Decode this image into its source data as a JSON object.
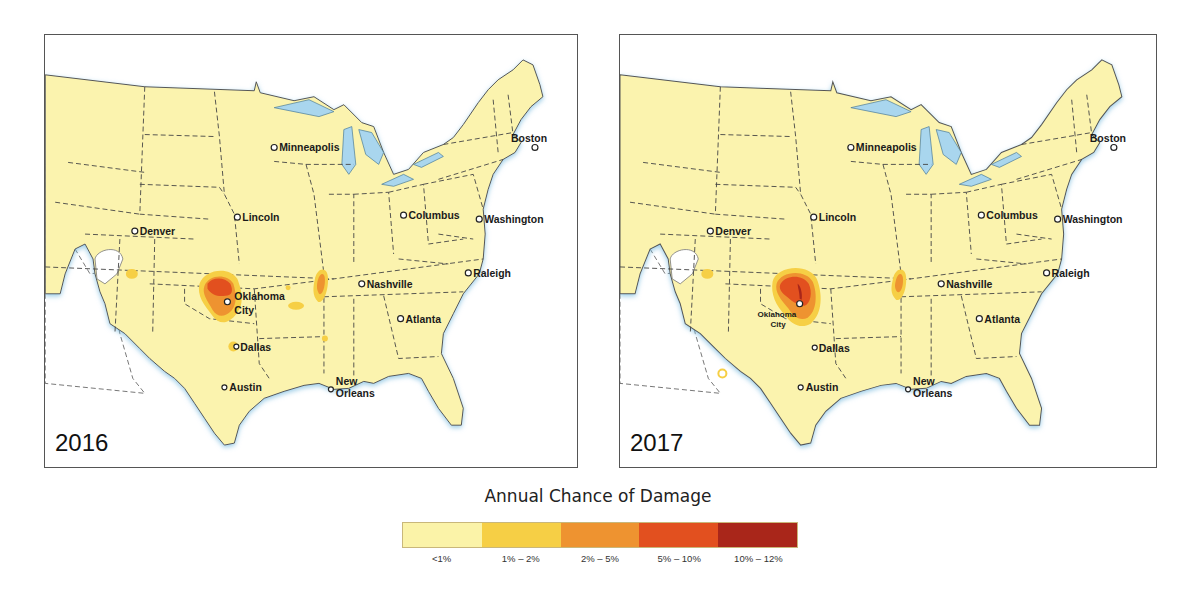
{
  "maps": [
    {
      "year": "2016",
      "cities": [
        {
          "name": "Minneapolis",
          "x": 230,
          "y": 108
        },
        {
          "name": "Boston",
          "x": 465,
          "y": 103
        },
        {
          "name": "Lincoln",
          "x": 193,
          "y": 183
        },
        {
          "name": "Columbus",
          "x": 360,
          "y": 181
        },
        {
          "name": "Washington",
          "x": 436,
          "y": 185
        },
        {
          "name": "Denver",
          "x": 90,
          "y": 197
        },
        {
          "name": "Raleigh",
          "x": 425,
          "y": 239
        },
        {
          "name": "Nashville",
          "x": 318,
          "y": 250
        },
        {
          "name": "Oklahoma",
          "x": 186,
          "y": 262
        },
        {
          "name": "City",
          "x": 186,
          "y": 276
        },
        {
          "name": "Atlanta",
          "x": 357,
          "y": 285
        },
        {
          "name": "Dallas",
          "x": 192,
          "y": 313
        },
        {
          "name": "Austin",
          "x": 180,
          "y": 354
        },
        {
          "name": "New",
          "x": 290,
          "y": 350
        },
        {
          "name": "Orleans",
          "x": 290,
          "y": 362
        }
      ]
    },
    {
      "year": "2017",
      "cities": [
        {
          "name": "Minneapolis",
          "x": 234,
          "y": 108
        },
        {
          "name": "Boston",
          "x": 473,
          "y": 103
        },
        {
          "name": "Lincoln",
          "x": 196,
          "y": 183
        },
        {
          "name": "Columbus",
          "x": 367,
          "y": 181
        },
        {
          "name": "Washington",
          "x": 443,
          "y": 185
        },
        {
          "name": "Denver",
          "x": 92,
          "y": 197
        },
        {
          "name": "Raleigh",
          "x": 432,
          "y": 239
        },
        {
          "name": "Nashville",
          "x": 326,
          "y": 250
        },
        {
          "name": "Oklahoma",
          "x": 140,
          "y": 275
        },
        {
          "name": "City",
          "x": 140,
          "y": 284
        },
        {
          "name": "Atlanta",
          "x": 364,
          "y": 285
        },
        {
          "name": "Dallas",
          "x": 198,
          "y": 313
        },
        {
          "name": "Austin",
          "x": 185,
          "y": 354
        },
        {
          "name": "New",
          "x": 295,
          "y": 350
        },
        {
          "name": "Orleans",
          "x": 295,
          "y": 362
        }
      ]
    }
  ],
  "legend": {
    "title": "Annual Chance of Damage",
    "items": [
      {
        "label": "<1%",
        "color": "#fbf3a8"
      },
      {
        "label": "1% – 2%",
        "color": "#f6cf45"
      },
      {
        "label": "2% – 5%",
        "color": "#ee9330"
      },
      {
        "label": "5% – 10%",
        "color": "#e2501f"
      },
      {
        "label": "10% – 12%",
        "color": "#a9261a"
      }
    ]
  },
  "colors": {
    "land": "#fbf3ae",
    "water": "#a9d6ee",
    "border": "#444444"
  }
}
